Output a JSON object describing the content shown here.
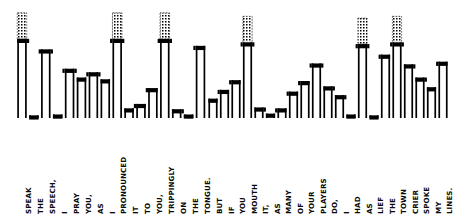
{
  "figure": {
    "type": "step-pitch-contour"
  },
  "chart_data": {
    "type": "bar",
    "subtitle": "",
    "xlabel": "",
    "ylabel": "Relative pitch level",
    "grid": false,
    "legend": null,
    "ylim": [
      0,
      10
    ],
    "panels": [
      {
        "name": "panel-left",
        "text": "SPEAK THE SPEECH, I PRAY YOU, AS I PRONOUNCED IT TO YOU, TRIPPINGLY ON THE TONGUE.",
        "categories": [
          "SPEAK",
          "THE",
          "SPEECH,",
          "I",
          "PRAY",
          "YOU,",
          "AS",
          "I",
          "PRONOUNCED",
          "IT",
          "TO",
          "YOU,",
          "TRIPPINGLY",
          "ON",
          "THE",
          "TONGUE."
        ],
        "values": [
          9.0,
          0.3,
          7.8,
          0.4,
          5.6,
          4.6,
          5.2,
          4.4,
          9.0,
          1.1,
          1.6,
          3.4,
          9.0,
          1.0,
          0.4,
          8.2
        ],
        "dotted_extension": [
          1,
          0,
          0,
          0,
          0,
          0,
          0,
          0,
          1,
          0,
          0,
          0,
          1,
          0,
          0,
          0
        ]
      },
      {
        "name": "panel-right",
        "text": "BUT IF YOU MOUTH IT, AS MANY OF YOUR PLAYERS DO, I HAD AS LIEF THE TOWN CRIER SPOKE MY LINES.",
        "categories": [
          "BUT",
          "IF",
          "YOU",
          "MOUTH",
          "IT,",
          "AS",
          "MANY",
          "OF",
          "YOUR",
          "PLAYERS",
          "DO,",
          "I",
          "HAD",
          "AS",
          "LIEF",
          "THE",
          "TOWN",
          "CRIER",
          "SPOKE",
          "MY",
          "LINES."
        ],
        "values": [
          2.2,
          3.2,
          4.3,
          8.6,
          1.2,
          0.5,
          1.1,
          3.0,
          4.2,
          6.2,
          3.6,
          2.6,
          0.4,
          8.4,
          0.3,
          7.2,
          8.6,
          6.1,
          4.6,
          3.5,
          6.4
        ],
        "dotted_extension": [
          0,
          0,
          0,
          1,
          0,
          0,
          0,
          0,
          0,
          0,
          0,
          0,
          0,
          1,
          0,
          0,
          1,
          0,
          0,
          0,
          0
        ]
      }
    ]
  },
  "labels": {
    "panel_left": [
      "SPEAK",
      "THE",
      "SPEECH,",
      "I",
      "PRAY",
      "YOU,",
      "AS",
      "I",
      "PRONOUNCED",
      "IT",
      "TO",
      "YOU,",
      "TRIPPINGLY",
      "ON",
      "THE",
      "TONGUE."
    ],
    "panel_right": [
      "BUT",
      "IF",
      "YOU",
      "MOUTH",
      "IT,",
      "AS",
      "MANY",
      "OF",
      "YOUR",
      "PLAYERS",
      "DO,",
      "I",
      "HAD",
      "AS",
      "LIEF",
      "THE",
      "TOWN",
      "CRIER",
      "SPOKE",
      "MY",
      "LINES."
    ]
  },
  "style": {
    "ink": "#000000",
    "paper": "#ffffff",
    "cap": "#000000",
    "stem_fill": "#ffffff",
    "dotted": "#000000"
  }
}
